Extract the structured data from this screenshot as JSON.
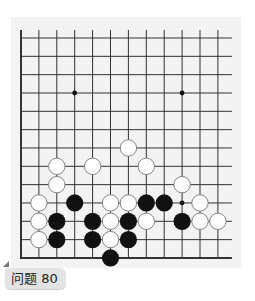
{
  "problem": {
    "label": "问题 80",
    "number": 80
  },
  "board": {
    "columns": 12,
    "rows": 13,
    "origin_x": 21,
    "origin_y": 38,
    "col_spacing": 17.9,
    "row_spacing": 18.33,
    "edges": {
      "left": true,
      "bottom": true,
      "top": false,
      "right": false
    },
    "hoshi": [
      [
        3,
        3
      ],
      [
        9,
        3
      ],
      [
        3,
        9
      ],
      [
        9,
        9
      ]
    ],
    "colors": {
      "line": "#333333",
      "black": "#111111",
      "white": "#ffffff",
      "white_border": "#777777",
      "background": "#f3f3f3"
    },
    "stones": [
      {
        "c": 6,
        "r": 6,
        "color": "white"
      },
      {
        "c": 2,
        "r": 7,
        "color": "white"
      },
      {
        "c": 4,
        "r": 7,
        "color": "white"
      },
      {
        "c": 7,
        "r": 7,
        "color": "white"
      },
      {
        "c": 2,
        "r": 8,
        "color": "white"
      },
      {
        "c": 9,
        "r": 8,
        "color": "white"
      },
      {
        "c": 1,
        "r": 9,
        "color": "white"
      },
      {
        "c": 3,
        "r": 9,
        "color": "black"
      },
      {
        "c": 5,
        "r": 9,
        "color": "white"
      },
      {
        "c": 6,
        "r": 9,
        "color": "white"
      },
      {
        "c": 7,
        "r": 9,
        "color": "black"
      },
      {
        "c": 8,
        "r": 9,
        "color": "black"
      },
      {
        "c": 10,
        "r": 9,
        "color": "white"
      },
      {
        "c": 1,
        "r": 10,
        "color": "white"
      },
      {
        "c": 2,
        "r": 10,
        "color": "black"
      },
      {
        "c": 4,
        "r": 10,
        "color": "black"
      },
      {
        "c": 5,
        "r": 10,
        "color": "white"
      },
      {
        "c": 6,
        "r": 10,
        "color": "black"
      },
      {
        "c": 7,
        "r": 10,
        "color": "white"
      },
      {
        "c": 9,
        "r": 10,
        "color": "black"
      },
      {
        "c": 10,
        "r": 10,
        "color": "white"
      },
      {
        "c": 11,
        "r": 10,
        "color": "white"
      },
      {
        "c": 1,
        "r": 11,
        "color": "white"
      },
      {
        "c": 2,
        "r": 11,
        "color": "black"
      },
      {
        "c": 4,
        "r": 11,
        "color": "black"
      },
      {
        "c": 5,
        "r": 11,
        "color": "white"
      },
      {
        "c": 6,
        "r": 11,
        "color": "black"
      },
      {
        "c": 5,
        "r": 12,
        "color": "black"
      }
    ]
  }
}
